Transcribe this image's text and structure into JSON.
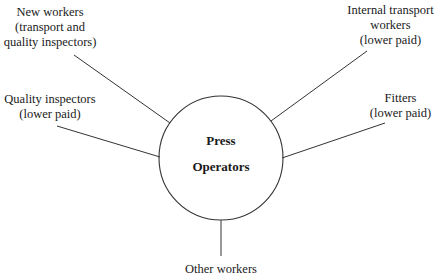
{
  "diagram": {
    "center": {
      "line1": "Press",
      "line2": "Operators"
    },
    "nodes": [
      {
        "line1": "New workers",
        "line2": "(transport and",
        "line3": "quality inspectors)"
      },
      {
        "line1": "Internal transport",
        "line2": "workers",
        "line3": "(lower paid)"
      },
      {
        "line1": "Quality inspectors",
        "line2": "(lower paid)"
      },
      {
        "line1": "Fitters",
        "line2": "(lower paid)"
      },
      {
        "line1": "Other workers"
      }
    ]
  }
}
